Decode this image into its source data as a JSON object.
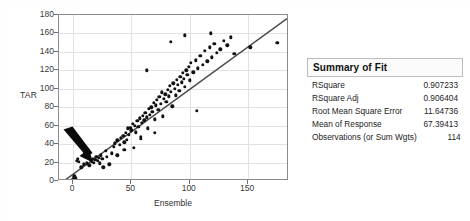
{
  "chart_data": {
    "type": "scatter",
    "title": "",
    "xlabel": "Ensemble",
    "ylabel": "TAR",
    "xlim": [
      -12,
      185
    ],
    "ylim": [
      0,
      180
    ],
    "xticks": [
      0,
      50,
      100,
      150
    ],
    "yticks": [
      0,
      20,
      40,
      60,
      80,
      100,
      120,
      140,
      160,
      180
    ],
    "grid": true,
    "legend": "none",
    "fit_line": {
      "label": "Linear Fit",
      "x": [
        -12,
        185
      ],
      "y": [
        -6,
        176
      ]
    },
    "annotations": [
      {
        "type": "arrow",
        "label": "arrow-pointing-to-low-value-cluster",
        "points_to_x": 4,
        "points_to_y": 23
      }
    ],
    "points": [
      [
        0,
        2
      ],
      [
        1,
        5
      ],
      [
        2,
        3
      ],
      [
        3,
        22
      ],
      [
        4,
        24
      ],
      [
        5,
        21
      ],
      [
        7,
        15
      ],
      [
        9,
        18
      ],
      [
        10,
        31
      ],
      [
        12,
        19
      ],
      [
        14,
        17
      ],
      [
        16,
        21
      ],
      [
        17,
        24
      ],
      [
        18,
        20
      ],
      [
        19,
        23
      ],
      [
        20,
        26
      ],
      [
        21,
        22
      ],
      [
        22,
        25
      ],
      [
        23,
        19
      ],
      [
        24,
        28
      ],
      [
        25,
        24
      ],
      [
        26,
        15
      ],
      [
        28,
        33
      ],
      [
        29,
        26
      ],
      [
        31,
        18
      ],
      [
        33,
        30
      ],
      [
        35,
        37
      ],
      [
        36,
        41
      ],
      [
        38,
        44
      ],
      [
        40,
        39
      ],
      [
        41,
        47
      ],
      [
        43,
        49
      ],
      [
        44,
        42
      ],
      [
        45,
        52
      ],
      [
        46,
        45
      ],
      [
        47,
        57
      ],
      [
        48,
        50
      ],
      [
        49,
        58
      ],
      [
        50,
        55
      ],
      [
        51,
        62
      ],
      [
        52,
        36
      ],
      [
        53,
        60
      ],
      [
        54,
        53
      ],
      [
        55,
        65
      ],
      [
        56,
        59
      ],
      [
        57,
        68
      ],
      [
        58,
        46
      ],
      [
        59,
        63
      ],
      [
        60,
        71
      ],
      [
        61,
        66
      ],
      [
        62,
        74
      ],
      [
        63,
        69
      ],
      [
        64,
        57
      ],
      [
        65,
        78
      ],
      [
        66,
        72
      ],
      [
        67,
        80
      ],
      [
        68,
        75
      ],
      [
        69,
        85
      ],
      [
        70,
        67
      ],
      [
        71,
        82
      ],
      [
        72,
        88
      ],
      [
        73,
        77
      ],
      [
        74,
        91
      ],
      [
        75,
        84
      ],
      [
        76,
        96
      ],
      [
        77,
        70
      ],
      [
        78,
        89
      ],
      [
        79,
        94
      ],
      [
        80,
        86
      ],
      [
        81,
        99
      ],
      [
        82,
        92
      ],
      [
        83,
        103
      ],
      [
        84,
        97
      ],
      [
        85,
        81
      ],
      [
        86,
        106
      ],
      [
        87,
        100
      ],
      [
        88,
        93
      ],
      [
        89,
        110
      ],
      [
        90,
        104
      ],
      [
        91,
        98
      ],
      [
        92,
        113
      ],
      [
        93,
        107
      ],
      [
        94,
        117
      ],
      [
        95,
        111
      ],
      [
        96,
        102
      ],
      [
        97,
        120
      ],
      [
        98,
        115
      ],
      [
        99,
        124
      ],
      [
        100,
        109
      ],
      [
        101,
        128
      ],
      [
        103,
        118
      ],
      [
        105,
        131
      ],
      [
        107,
        122
      ],
      [
        109,
        136
      ],
      [
        111,
        126
      ],
      [
        113,
        141
      ],
      [
        115,
        130
      ],
      [
        117,
        145
      ],
      [
        119,
        134
      ],
      [
        121,
        149
      ],
      [
        123,
        139
      ],
      [
        126,
        143
      ],
      [
        129,
        152
      ],
      [
        132,
        147
      ],
      [
        135,
        156
      ],
      [
        63,
        120
      ],
      [
        84,
        151
      ],
      [
        96,
        158
      ],
      [
        118,
        160
      ],
      [
        138,
        138
      ],
      [
        152,
        145
      ],
      [
        70,
        52
      ],
      [
        58,
        48
      ],
      [
        38,
        28
      ],
      [
        44,
        34
      ],
      [
        106,
        76
      ],
      [
        175,
        150
      ]
    ]
  },
  "summary_of_fit": {
    "title": "Summary of Fit",
    "rows": [
      {
        "label": "RSquare",
        "value": "0.907233"
      },
      {
        "label": "RSquare Adj",
        "value": "0.906404"
      },
      {
        "label": "Root Mean Square Error",
        "value": "11.64736"
      },
      {
        "label": "Mean of Response",
        "value": "67.39413"
      },
      {
        "label": "Observations (or Sum Wgts)",
        "value": "114"
      }
    ]
  },
  "colors": {
    "point": "#121212",
    "fit_line": "#4a4a4a",
    "grid": "#e2e2e6",
    "frame": "#8a8a8a",
    "text": "#1d1d1d",
    "annotation_arrow": "#0a0a0a"
  }
}
